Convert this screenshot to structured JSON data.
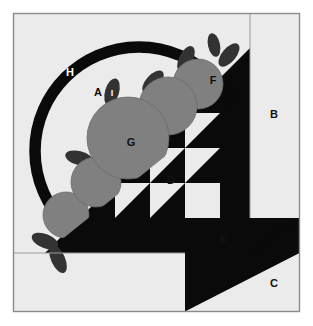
{
  "figure": {
    "type": "quilt-block-diagram",
    "canvas": {
      "width": 313,
      "height": 326
    },
    "frame": {
      "x": 13,
      "y": 13,
      "width": 287,
      "height": 299,
      "border_color": "#8a8a8a",
      "fill": "#ebebeb"
    },
    "colors": {
      "page_background": "#ffffff",
      "block_background": "#ebebeb",
      "black": "#0a0a0a",
      "gray_apple": "#808080",
      "leaf_dark": "#333333",
      "border": "#8a8a8a",
      "label_dark": "#111111",
      "label_light": "#ffffff"
    },
    "guides": {
      "vertical_line_x": 250,
      "horizontal_line_y": 253,
      "diagonal": {
        "x1": 45,
        "y1": 253,
        "x2": 250,
        "y2": 48
      }
    },
    "grid": {
      "cell_size": 35,
      "columns_x": [
        115,
        150,
        185,
        220
      ],
      "rows_y": [
        113,
        148,
        183,
        218
      ]
    },
    "labels": [
      {
        "id": "A",
        "text": "A",
        "x": 98,
        "y": 92,
        "style": "dark",
        "region": "background-inside-arc"
      },
      {
        "id": "B",
        "text": "B",
        "x": 274,
        "y": 114,
        "style": "dark",
        "region": "right-side-strip"
      },
      {
        "id": "C",
        "text": "C",
        "x": 274,
        "y": 283,
        "style": "dark",
        "region": "bottom-right-corner"
      },
      {
        "id": "D",
        "text": "D",
        "x": 171,
        "y": 180,
        "style": "dark",
        "region": "half-square-triangle-light"
      },
      {
        "id": "E",
        "text": "E",
        "x": 224,
        "y": 238,
        "style": "dark",
        "region": "plain-light-square"
      },
      {
        "id": "F",
        "text": "F",
        "x": 213,
        "y": 80,
        "style": "dark",
        "region": "small-apple"
      },
      {
        "id": "G",
        "text": "G",
        "x": 131,
        "y": 142,
        "style": "dark",
        "region": "large-apple"
      },
      {
        "id": "H",
        "text": "H",
        "x": 70,
        "y": 72,
        "style": "light",
        "region": "black-arc"
      },
      {
        "id": "I",
        "text": "I",
        "x": 111,
        "y": 93,
        "style": "light",
        "region": "leaf"
      }
    ],
    "arc": {
      "center_x": 139,
      "center_y": 151,
      "radius": 104,
      "stroke_width": 11,
      "start_angle_deg": 135,
      "end_angle_deg": -45
    },
    "apples": [
      {
        "name": "apple-large-g",
        "cx": 128,
        "cy": 138,
        "r": 41
      },
      {
        "name": "apple-mid",
        "cx": 168,
        "cy": 106,
        "r": 29
      },
      {
        "name": "apple-f",
        "cx": 198,
        "cy": 84,
        "r": 25
      },
      {
        "name": "apple-lower-mid",
        "cx": 96,
        "cy": 182,
        "r": 25
      },
      {
        "name": "apple-lower",
        "cx": 66,
        "cy": 215,
        "r": 23
      }
    ],
    "leaves": [
      {
        "name": "leaf-i",
        "cx": 112,
        "cy": 92,
        "rx": 7,
        "ry": 14,
        "rot": 18
      },
      {
        "name": "leaf-upper-right-of-g",
        "cx": 152,
        "cy": 82,
        "rx": 7,
        "ry": 14,
        "rot": 40
      },
      {
        "name": "leaf-mid",
        "cx": 186,
        "cy": 60,
        "rx": 7,
        "ry": 14,
        "rot": 28
      },
      {
        "name": "leaf-f-right",
        "cx": 228,
        "cy": 54,
        "rx": 7,
        "ry": 14,
        "rot": 40
      },
      {
        "name": "leaf-f-top",
        "cx": 214,
        "cy": 45,
        "rx": 6,
        "ry": 12,
        "rot": -10
      },
      {
        "name": "leaf-left-of-g",
        "cx": 79,
        "cy": 158,
        "rx": 7,
        "ry": 14,
        "rot": 100
      },
      {
        "name": "leaf-bottom-left-a",
        "cx": 45,
        "cy": 240,
        "rx": 7,
        "ry": 14,
        "rot": 115
      },
      {
        "name": "leaf-bottom-left-b",
        "cx": 58,
        "cy": 258,
        "rx": 7,
        "ry": 15,
        "rot": 155
      }
    ],
    "pattern_units": [
      {
        "name": "hst-r1c3",
        "col": 3,
        "row": 1,
        "kind": "light-upper-left"
      },
      {
        "name": "hst-r2c2",
        "col": 2,
        "row": 2,
        "kind": "light-upper-left"
      },
      {
        "name": "hst-r2c3",
        "col": 3,
        "row": 2,
        "kind": "light-upper-left"
      },
      {
        "name": "hst-r3c1",
        "col": 1,
        "row": 3,
        "kind": "light-upper-left"
      },
      {
        "name": "hst-r3c2",
        "col": 2,
        "row": 3,
        "kind": "light-upper-left"
      },
      {
        "name": "square-r3c3-e",
        "col": 3,
        "row": 3,
        "kind": "solid-light"
      },
      {
        "name": "corner-hst-c",
        "kind": "light-lower-right"
      }
    ]
  }
}
